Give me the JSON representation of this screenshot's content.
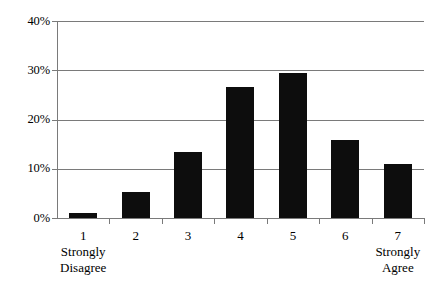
{
  "chart_data": {
    "type": "bar",
    "title": "",
    "subtitle": "",
    "xlabel": "",
    "ylabel": "",
    "categories": [
      "1",
      "2",
      "3",
      "4",
      "5",
      "6",
      "7"
    ],
    "values": [
      1.0,
      5.3,
      13.5,
      26.6,
      29.4,
      15.9,
      11.0
    ],
    "value_labels": [
      "1%",
      "5.3%",
      "13.5%",
      "26.6%",
      "29.4%",
      "15.9%",
      "11%"
    ],
    "ylim": [
      0,
      40
    ],
    "ytick_values": [
      0,
      10,
      20,
      30,
      40
    ],
    "ytick_labels": [
      "0%",
      "10%",
      "20%",
      "30%",
      "40%"
    ],
    "grid": true,
    "grid_axis": "y",
    "legend": false,
    "legend_position": "none",
    "bar_color": "#0d0d0d",
    "grid_color": "#7a7a7a",
    "axis_color": "#7a7a7a",
    "background": "#ffffff",
    "annotations": [
      {
        "at_category": "1",
        "text_line1": "Strongly",
        "text_line2": "Disagree"
      },
      {
        "at_category": "7",
        "text_line1": "Strongly",
        "text_line2": "Agree"
      }
    ]
  },
  "anchors": {
    "left_line1": "Strongly",
    "left_line2": "Disagree",
    "right_line1": "Strongly",
    "right_line2": "Agree"
  }
}
